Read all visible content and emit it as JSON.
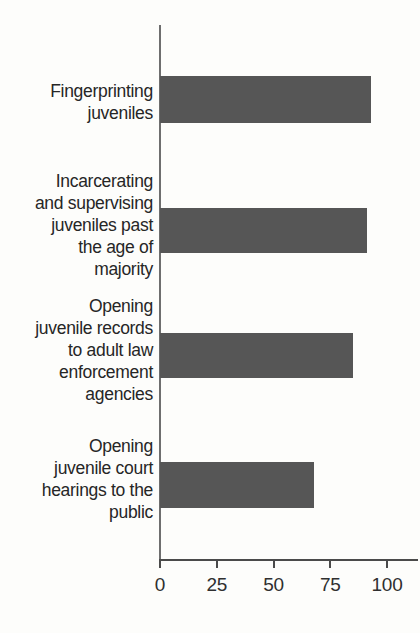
{
  "chart_data": {
    "type": "bar",
    "orientation": "horizontal",
    "title": "",
    "subtitle": "",
    "xlabel": "",
    "ylabel": "",
    "xlim": [
      0,
      110
    ],
    "xticks": [
      0,
      25,
      50,
      75,
      100
    ],
    "xtick_labels": [
      "0",
      "25",
      "50",
      "75",
      "100"
    ],
    "grid": false,
    "legend": null,
    "bar_color": "#565656",
    "background_color": "#fdfdfb",
    "axis_color": "#4a4a4a",
    "categories": [
      "Fingerprinting\njuveniles",
      "Incarcerating\nand supervising\njuveniles past\nthe age of\nmajority",
      "Opening\njuvenile records\nto adult law\nenforcement\nagencies",
      "Opening\njuvenile court\nhearings to the\npublic"
    ],
    "values": [
      93,
      91,
      85,
      68
    ],
    "series": [
      {
        "name": "Percent",
        "values": [
          93,
          91,
          85,
          68
        ]
      }
    ]
  },
  "axis": {
    "ticks": [
      {
        "label": "0",
        "value": 0
      },
      {
        "label": "25",
        "value": 25
      },
      {
        "label": "50",
        "value": 50
      },
      {
        "label": "75",
        "value": 75
      },
      {
        "label": "100",
        "value": 100
      }
    ]
  },
  "bars": [
    {
      "label": "Fingerprinting\njuveniles",
      "value": 93,
      "top": 76,
      "height": 47,
      "label_top": 80
    },
    {
      "label": "Incarcerating\nand supervising\njuveniles past\nthe age of\nmajority",
      "value": 91,
      "top": 208,
      "height": 45,
      "label_top": 170
    },
    {
      "label": "Opening\njuvenile records\nto adult law\nenforcement\nagencies",
      "value": 85,
      "top": 333,
      "height": 45,
      "label_top": 295
    },
    {
      "label": "Opening\njuvenile court\nhearings to the\npublic",
      "value": 68,
      "top": 462,
      "height": 46,
      "label_top": 435
    }
  ]
}
